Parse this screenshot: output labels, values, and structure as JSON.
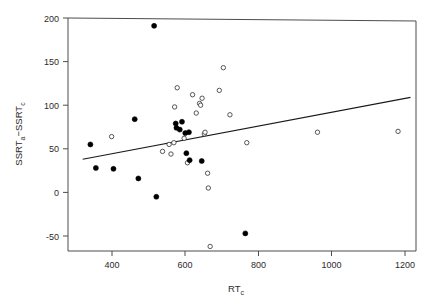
{
  "figure": {
    "background_color": "#ffffff",
    "axis_color": "#4d4d4d",
    "line_color": "#1a1a1a",
    "filled_marker_color": "#000000",
    "open_marker_color": "#ffffff"
  },
  "chart_data": {
    "type": "scatter",
    "title": "",
    "xlabel": "RTc",
    "xlabel_main": "RT",
    "xlabel_sub": "c",
    "ylabel": "SSRTa−SSRTc",
    "ylabel_parts": [
      "SSRT",
      "a",
      "−SSRT",
      "c"
    ],
    "xlim": [
      320,
      1215
    ],
    "ylim": [
      -75,
      200
    ],
    "xticks": [
      400,
      600,
      800,
      1000,
      1200
    ],
    "xtick_labels": [
      "400",
      "600",
      "800",
      "1000",
      "1200"
    ],
    "yticks": [
      -50,
      0,
      50,
      100,
      150,
      200
    ],
    "ytick_labels": [
      "-50",
      "0",
      "50",
      "100",
      "150",
      "200"
    ],
    "grid": false,
    "legend": null,
    "series": [
      {
        "name": "filled",
        "marker": "filled-circle",
        "points": [
          [
            341,
            55
          ],
          [
            356,
            28
          ],
          [
            404,
            27
          ],
          [
            462,
            84
          ],
          [
            472,
            16
          ],
          [
            515,
            191
          ],
          [
            521,
            -5
          ],
          [
            574,
            79
          ],
          [
            576,
            74
          ],
          [
            585,
            72
          ],
          [
            591,
            81
          ],
          [
            600,
            68
          ],
          [
            603,
            45
          ],
          [
            610,
            69
          ],
          [
            612,
            37
          ],
          [
            645,
            36
          ],
          [
            764,
            -47
          ]
        ]
      },
      {
        "name": "open",
        "marker": "open-circle",
        "points": [
          [
            399,
            64
          ],
          [
            538,
            47
          ],
          [
            556,
            55
          ],
          [
            561,
            44
          ],
          [
            569,
            57
          ],
          [
            571,
            98
          ],
          [
            578,
            120
          ],
          [
            597,
            62
          ],
          [
            606,
            34
          ],
          [
            620,
            112
          ],
          [
            630,
            91
          ],
          [
            639,
            102
          ],
          [
            642,
            100
          ],
          [
            646,
            108
          ],
          [
            652,
            67
          ],
          [
            654,
            69
          ],
          [
            661,
            22
          ],
          [
            663,
            5
          ],
          [
            668,
            -62
          ],
          [
            693,
            117
          ],
          [
            704,
            143
          ],
          [
            722,
            89
          ],
          [
            768,
            57
          ],
          [
            961,
            69
          ],
          [
            1181,
            70
          ]
        ]
      }
    ],
    "fit_line": {
      "name": "regression-line",
      "x_start": 320,
      "y_start": 38,
      "x_end": 1215,
      "y_end": 109
    }
  },
  "axes": {
    "x_axis_name": "x-axis",
    "y_axis_name": "y-axis"
  }
}
